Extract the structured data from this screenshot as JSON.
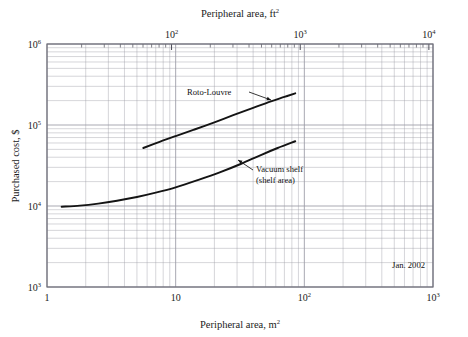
{
  "figure": {
    "background_color": "#ffffff",
    "grid_color": "#9a9aa5",
    "frame_color": "#6f6f7a",
    "curve_color": "#141414",
    "text_color": "#1b1b1b"
  },
  "chart_data": {
    "type": "line",
    "title": "",
    "xlabel": "Peripheral area, m",
    "xlabel_exponent": "2",
    "ylabel": "Purchased cost, $",
    "top_axis_label": "Peripheral area, ft",
    "top_axis_exponent": "2",
    "xscale": "log",
    "yscale": "log",
    "xlim": [
      1,
      1000
    ],
    "ylim": [
      1000,
      1000000
    ],
    "grid": true,
    "grid_minor": true,
    "legend_position": "inline-annotations",
    "x_tick_labels": [
      "1",
      "10",
      "10",
      "10"
    ],
    "x_tick_exponents": [
      "",
      "",
      "2",
      "3"
    ],
    "x_tick_values": [
      1,
      10,
      100,
      1000
    ],
    "y_tick_labels": [
      "10",
      "10",
      "10",
      "10"
    ],
    "y_tick_exponents": [
      "3",
      "4",
      "5",
      "6"
    ],
    "y_tick_values": [
      1000,
      10000,
      100000,
      1000000
    ],
    "top_tick_labels": [
      "10",
      "10",
      "10"
    ],
    "top_tick_exponents": [
      "2",
      "3",
      "4"
    ],
    "top_tick_values_ft2": [
      100,
      1000,
      10000
    ],
    "ft2_per_m2": 10.7639,
    "annotation_date": "Jan. 2002",
    "series": [
      {
        "name": "Roto-Louvre",
        "label": "Roto-Louvre",
        "label_lines": [
          "Roto-Louvre"
        ],
        "x": [
          5.6,
          7.5,
          10,
          14,
          20,
          28,
          40,
          55,
          70,
          85
        ],
        "y": [
          52000,
          62000,
          73000,
          88000,
          108000,
          132000,
          163000,
          196000,
          222000,
          246000
        ]
      },
      {
        "name": "Vacuum shelf (shelf area)",
        "label": "Vacuum shelf",
        "label_lines": [
          "Vacuum shelf",
          "(shelf area)"
        ],
        "x": [
          1.3,
          1.8,
          2.5,
          3.5,
          5,
          7,
          10,
          15,
          22,
          32,
          45,
          62,
          85
        ],
        "y": [
          9800,
          10100,
          10700,
          11600,
          12900,
          14600,
          17000,
          21000,
          26000,
          33000,
          42000,
          52000,
          63000
        ]
      }
    ],
    "annotations": [
      {
        "name": "roto-louvre-callout",
        "text": "Roto-Louvre",
        "text_x": 5.0,
        "text_y": 320000,
        "point_x": 28,
        "point_y": 132000
      },
      {
        "name": "vacuum-shelf-callout",
        "text": "Vacuum shelf (shelf area)",
        "text_x": 30,
        "text_y": 28000,
        "point_x": 17,
        "point_y": 23000
      }
    ]
  }
}
